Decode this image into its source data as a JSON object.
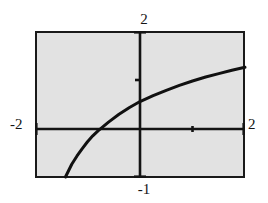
{
  "figure": {
    "name": "function-graph",
    "background_color": "#ffffff",
    "plot_fill_color": "#e2e2e2",
    "frame_color": "#1a1a1a",
    "curve_color": "#111111"
  },
  "labels": {
    "top": "2",
    "left": "-2",
    "right": "2",
    "bottom": "-1"
  },
  "chart_data": {
    "type": "line",
    "title": "",
    "xlabel": "",
    "ylabel": "",
    "xlim": [
      -2,
      2
    ],
    "ylim": [
      -1,
      2
    ],
    "grid": false,
    "legend": null,
    "axis_tick_labels": {
      "x_min": "-2",
      "x_max": "2",
      "y_min": "-1",
      "y_max": "2"
    },
    "x_ticks": [
      -2,
      1,
      2
    ],
    "y_ticks": [
      -1,
      1,
      2
    ],
    "series": [
      {
        "name": "curve",
        "x": [
          -1.42,
          -1.3,
          -1.2,
          -1.1,
          -1.0,
          -0.9,
          -0.8,
          -0.6,
          -0.4,
          -0.2,
          0.0,
          0.25,
          0.5,
          0.75,
          1.0,
          1.25,
          1.5,
          1.75,
          2.0
        ],
        "y": [
          -0.98,
          -0.72,
          -0.55,
          -0.4,
          -0.26,
          -0.14,
          -0.04,
          0.14,
          0.3,
          0.44,
          0.56,
          0.68,
          0.79,
          0.89,
          0.98,
          1.06,
          1.13,
          1.2,
          1.26
        ]
      }
    ]
  }
}
